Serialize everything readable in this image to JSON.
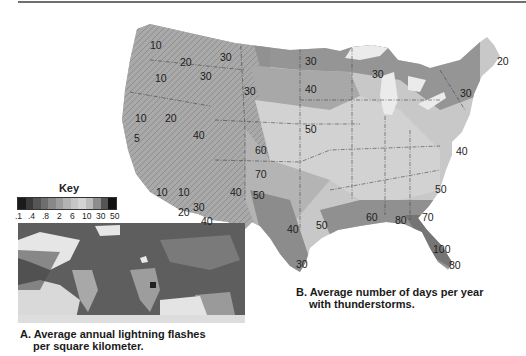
{
  "figure": {
    "panel_a": {
      "caption_line1": "A. Average annual lightning flashes",
      "caption_line2": "per square kilometer.",
      "key": {
        "title": "Key",
        "ticks": [
          ".1",
          ".4",
          ".8",
          "2",
          "6",
          "10",
          "30",
          "50"
        ],
        "swatches": [
          "#1a1a1a",
          "#3a3a3a",
          "#555555",
          "#6e6e6e",
          "#888888",
          "#9d9d9d",
          "#b3b3b3",
          "#c6c6c6",
          "#d3d3d3",
          "#bcbcbc",
          "#8d8d8d",
          "#555555",
          "#111111"
        ]
      }
    },
    "panel_b": {
      "caption_line1": "B. Average number of days per year",
      "caption_line2": "with thunderstorms.",
      "contour_labels": [
        {
          "text": "10",
          "x": 150,
          "y": 40
        },
        {
          "text": "20",
          "x": 180,
          "y": 57
        },
        {
          "text": "30",
          "x": 220,
          "y": 52
        },
        {
          "text": "30",
          "x": 200,
          "y": 71
        },
        {
          "text": "10",
          "x": 155,
          "y": 73
        },
        {
          "text": "30",
          "x": 244,
          "y": 86
        },
        {
          "text": "10",
          "x": 135,
          "y": 113
        },
        {
          "text": "20",
          "x": 165,
          "y": 113
        },
        {
          "text": "5",
          "x": 134,
          "y": 133
        },
        {
          "text": "40",
          "x": 193,
          "y": 130
        },
        {
          "text": "60",
          "x": 255,
          "y": 145
        },
        {
          "text": "70",
          "x": 255,
          "y": 169
        },
        {
          "text": "10",
          "x": 156,
          "y": 187
        },
        {
          "text": "10",
          "x": 178,
          "y": 187
        },
        {
          "text": "40",
          "x": 230,
          "y": 187
        },
        {
          "text": "50",
          "x": 253,
          "y": 190
        },
        {
          "text": "20",
          "x": 178,
          "y": 207
        },
        {
          "text": "30",
          "x": 193,
          "y": 202
        },
        {
          "text": "40",
          "x": 201,
          "y": 216
        },
        {
          "text": "40",
          "x": 287,
          "y": 224
        },
        {
          "text": "50",
          "x": 316,
          "y": 220
        },
        {
          "text": "30",
          "x": 305,
          "y": 56
        },
        {
          "text": "40",
          "x": 305,
          "y": 84
        },
        {
          "text": "50",
          "x": 305,
          "y": 124
        },
        {
          "text": "30",
          "x": 372,
          "y": 69
        },
        {
          "text": "20",
          "x": 497,
          "y": 56
        },
        {
          "text": "30",
          "x": 460,
          "y": 88
        },
        {
          "text": "40",
          "x": 456,
          "y": 146
        },
        {
          "text": "50",
          "x": 435,
          "y": 184
        },
        {
          "text": "60",
          "x": 366,
          "y": 212
        },
        {
          "text": "80",
          "x": 395,
          "y": 215
        },
        {
          "text": "70",
          "x": 422,
          "y": 212
        },
        {
          "text": "100",
          "x": 433,
          "y": 244
        },
        {
          "text": "80",
          "x": 449,
          "y": 260
        },
        {
          "text": "30",
          "x": 296,
          "y": 259
        }
      ]
    }
  }
}
